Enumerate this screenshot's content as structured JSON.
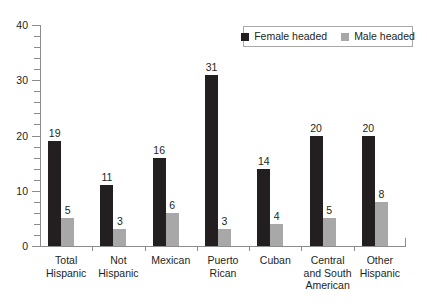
{
  "legend": {
    "entries": [
      {
        "label": "Female headed",
        "color": "#231f20",
        "icon": "square-swatch-icon"
      },
      {
        "label": "Male headed",
        "color": "#a8a8a8",
        "icon": "square-swatch-icon"
      }
    ]
  },
  "axes": {
    "y_tick_labels": [
      "40",
      "30",
      "20",
      "10",
      "0"
    ],
    "y_min": 0,
    "y_max": 40
  },
  "chart_data": {
    "type": "bar",
    "title": "",
    "subtitle": "",
    "xlabel": "",
    "ylabel": "",
    "ylim": [
      0,
      40
    ],
    "ytick_labels": [
      "0",
      "10",
      "20",
      "30",
      "40"
    ],
    "ytick_values": [
      0,
      10,
      20,
      30,
      40
    ],
    "minor_tick_step": 2,
    "grid": false,
    "legend_position": "top-right",
    "categories": [
      "Total Hispanic",
      "Not Hispanic",
      "Mexican",
      "Puerto Rican",
      "Cuban",
      "Central and South American",
      "Other Hispanic"
    ],
    "category_lines": [
      [
        "Total",
        "Hispanic"
      ],
      [
        "Not",
        "Hispanic"
      ],
      [
        "Mexican"
      ],
      [
        "Puerto",
        "Rican"
      ],
      [
        "Cuban"
      ],
      [
        "Central",
        "and South",
        "American"
      ],
      [
        "Other",
        "Hispanic"
      ]
    ],
    "series": [
      {
        "name": "Female headed",
        "color": "#231f20",
        "values": [
          19,
          11,
          16,
          31,
          14,
          20,
          20
        ],
        "labels": [
          "19",
          "11",
          "16",
          "31",
          "14",
          "20",
          "20"
        ]
      },
      {
        "name": "Male headed",
        "color": "#a8a8a8",
        "values": [
          5,
          3,
          6,
          3,
          4,
          5,
          8
        ],
        "labels": [
          "5",
          "3",
          "6",
          "3",
          "4",
          "5",
          "8"
        ]
      }
    ]
  }
}
